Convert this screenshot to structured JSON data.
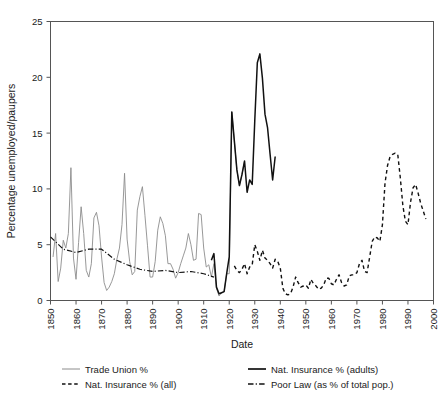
{
  "chart_data": {
    "type": "line",
    "title": "",
    "xlabel": "Date",
    "ylabel": "Percentage unemployed/paupers",
    "xlim": [
      1850,
      2000
    ],
    "ylim": [
      0,
      25
    ],
    "xticks": [
      1850,
      1860,
      1870,
      1880,
      1890,
      1900,
      1910,
      1920,
      1930,
      1940,
      1950,
      1960,
      1970,
      1980,
      1990,
      2000
    ],
    "xticklabels": [
      "1850",
      "1860",
      "1870",
      "1880",
      "1890",
      "1900",
      "1910",
      "1920",
      "1930",
      "1940",
      "1950",
      "1960",
      "1970",
      "1980",
      "1990",
      "2000"
    ],
    "yticks": [
      0,
      5,
      10,
      15,
      20,
      25
    ],
    "yticklabels": [
      "0",
      "5",
      "10",
      "15",
      "20",
      "25"
    ],
    "grid": false,
    "legend_position": "below",
    "series": [
      {
        "name": "Trade Union %",
        "style": "solid",
        "color": "#8c8c8c",
        "width": 0.9,
        "x": [
          1851,
          1852,
          1853,
          1854,
          1855,
          1856,
          1857,
          1858,
          1859,
          1860,
          1861,
          1862,
          1863,
          1864,
          1865,
          1866,
          1867,
          1868,
          1869,
          1870,
          1871,
          1872,
          1873,
          1874,
          1875,
          1876,
          1877,
          1878,
          1879,
          1880,
          1881,
          1882,
          1883,
          1884,
          1885,
          1886,
          1887,
          1888,
          1889,
          1890,
          1891,
          1892,
          1893,
          1894,
          1895,
          1896,
          1897,
          1898,
          1899,
          1900,
          1901,
          1902,
          1903,
          1904,
          1905,
          1906,
          1907,
          1908,
          1909,
          1910,
          1911,
          1912,
          1913,
          1914,
          1915,
          1916,
          1917,
          1918,
          1919,
          1920,
          1921,
          1922,
          1923,
          1924,
          1925,
          1926
        ],
        "values": [
          3.9,
          6.0,
          1.7,
          2.9,
          5.4,
          4.7,
          6.0,
          11.9,
          3.8,
          1.9,
          5.2,
          8.4,
          6.0,
          2.7,
          2.1,
          3.3,
          7.4,
          7.9,
          6.7,
          3.9,
          1.6,
          0.9,
          1.2,
          1.7,
          2.4,
          3.7,
          4.7,
          6.8,
          11.4,
          5.5,
          3.5,
          2.3,
          2.6,
          8.1,
          9.3,
          10.2,
          7.6,
          4.9,
          2.1,
          2.1,
          3.5,
          6.3,
          7.5,
          6.9,
          5.8,
          3.3,
          3.3,
          2.8,
          2.0,
          2.5,
          3.3,
          4.0,
          4.7,
          6.0,
          5.0,
          3.6,
          3.7,
          7.8,
          7.7,
          4.7,
          3.0,
          3.2,
          2.1,
          3.3,
          1.1,
          0.4,
          0.7,
          0.8,
          2.4,
          2.4,
          16.9,
          14.3,
          11.7,
          10.3,
          11.3,
          12.5
        ]
      },
      {
        "name": "Nat. Insurance % (adults)",
        "style": "solid",
        "color": "#111111",
        "width": 1.5,
        "x": [
          1913,
          1914,
          1915,
          1916,
          1917,
          1918,
          1919,
          1920,
          1921,
          1922,
          1923,
          1924,
          1925,
          1926,
          1927,
          1928,
          1929,
          1930,
          1931,
          1932,
          1933,
          1934,
          1935,
          1936,
          1937,
          1938
        ],
        "values": [
          3.6,
          4.2,
          1.2,
          0.6,
          0.7,
          0.8,
          2.4,
          3.9,
          16.9,
          14.3,
          11.7,
          10.3,
          11.3,
          12.5,
          9.7,
          10.8,
          10.4,
          16.1,
          21.3,
          22.1,
          19.9,
          16.7,
          15.5,
          13.1,
          10.8,
          12.9
        ]
      },
      {
        "name": "Nat. Insurance % (all)",
        "style": "dashed",
        "color": "#111111",
        "width": 1.4,
        "x": [
          1922,
          1923,
          1924,
          1925,
          1926,
          1927,
          1928,
          1929,
          1930,
          1931,
          1932,
          1933,
          1934,
          1935,
          1936,
          1937,
          1938,
          1939,
          1940,
          1941,
          1942,
          1943,
          1944,
          1945,
          1946,
          1947,
          1948,
          1949,
          1950,
          1951,
          1952,
          1953,
          1954,
          1955,
          1956,
          1957,
          1958,
          1959,
          1960,
          1961,
          1962,
          1963,
          1964,
          1965,
          1966,
          1967,
          1968,
          1969,
          1970,
          1971,
          1972,
          1973,
          1974,
          1975,
          1976,
          1977,
          1978,
          1979,
          1980,
          1981,
          1982,
          1983,
          1984,
          1985,
          1986,
          1987,
          1988,
          1989,
          1990,
          1991,
          1992,
          1993,
          1994,
          1995,
          1996,
          1997
        ],
        "values": [
          3.1,
          2.7,
          2.5,
          2.8,
          3.3,
          2.4,
          3.0,
          3.2,
          5.0,
          4.4,
          3.6,
          4.5,
          3.8,
          3.6,
          3.3,
          2.9,
          3.7,
          3.5,
          2.9,
          1.1,
          0.6,
          0.5,
          0.6,
          1.2,
          2.1,
          1.6,
          1.2,
          1.3,
          1.4,
          1.1,
          1.9,
          1.5,
          1.3,
          1.0,
          1.1,
          1.4,
          2.0,
          2.0,
          1.5,
          1.4,
          1.9,
          2.3,
          1.6,
          1.3,
          1.4,
          2.2,
          2.3,
          2.3,
          2.5,
          3.3,
          3.6,
          2.6,
          2.5,
          3.9,
          5.3,
          5.7,
          5.6,
          5.3,
          6.8,
          10.5,
          12.1,
          12.9,
          13.1,
          13.2,
          13.1,
          11.0,
          8.5,
          7.1,
          6.8,
          8.8,
          10.1,
          10.4,
          9.6,
          8.7,
          8.0,
          7.3
        ]
      },
      {
        "name": "Poor Law (as % of total pop.)",
        "style": "dashdot",
        "color": "#111111",
        "width": 1.2,
        "x": [
          1850,
          1855,
          1860,
          1865,
          1870,
          1875,
          1880,
          1885,
          1890,
          1895,
          1900,
          1905,
          1910,
          1914
        ],
        "values": [
          5.7,
          4.6,
          4.3,
          4.6,
          4.6,
          3.7,
          3.2,
          2.8,
          2.6,
          2.7,
          2.5,
          2.6,
          2.4,
          2.1
        ]
      }
    ]
  },
  "legend": {
    "entries": [
      {
        "label": "Trade Union %",
        "style": "solid-gray"
      },
      {
        "label": "Nat. Insurance % (adults)",
        "style": "solid-black"
      },
      {
        "label": "Nat. Insurance % (all)",
        "style": "dashed"
      },
      {
        "label": "Poor Law (as % of total pop.)",
        "style": "dashdot"
      }
    ]
  }
}
